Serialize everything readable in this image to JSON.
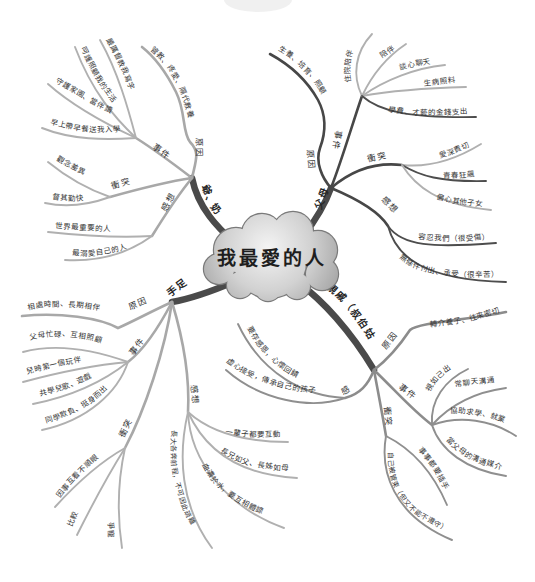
{
  "center": {
    "title": "我最愛的人"
  },
  "branches": [
    {
      "label": "爺、奶",
      "subs": [
        {
          "label": "原因",
          "items": [
            "管教、疼愛、隔代教養"
          ]
        },
        {
          "label": "事件",
          "items": [
            "嚴厲督教我寫字",
            "呵護照顧我的生活",
            "守護家園、當伴讀",
            "早上帶早餐送我入學"
          ]
        },
        {
          "label": "衝突",
          "items": [
            "觀念差異",
            "督其勤快"
          ]
        },
        {
          "label": "感想",
          "items": [
            "世界最重要的人",
            "最溺愛自己的人"
          ]
        }
      ]
    },
    {
      "label": "父母",
      "subs": [
        {
          "label": "原因",
          "items": [
            "生養、培育、照顧"
          ]
        },
        {
          "label": "事件",
          "items": [
            "住院陪伴",
            "陪伴",
            "談心聊天",
            "生病照料",
            "學費、才藝的金錢支出"
          ]
        },
        {
          "label": "衝突",
          "items": [
            "愛深責切",
            "青春狂飆",
            "偏心其他子女"
          ]
        },
        {
          "label": "感想",
          "items": [
            "容忍我們（很受傷）",
            "無條件付出、承受（很辛苦）"
          ]
        }
      ]
    },
    {
      "label": "親戚（叔伯姑姨）",
      "subs": [
        {
          "label": "原因",
          "items": [
            "轉介養子、往來密切"
          ]
        },
        {
          "label": "事件",
          "items": [
            "視如己出",
            "常聊天溝通",
            "協助求學、就業",
            "當父母的溝通媒介"
          ]
        },
        {
          "label": "衝突",
          "items": [
            "事事都要插手",
            "自己被管束（但又不能不遵守）"
          ]
        },
        {
          "label": "感想",
          "items": [
            "要存感恩，心懷回饋",
            "虛心接受，傳承自己的孩子"
          ]
        }
      ]
    },
    {
      "label": "手足",
      "subs": [
        {
          "label": "原因",
          "items": [
            "相處時間、長期相伴"
          ]
        },
        {
          "label": "事件",
          "items": [
            "父母忙碌、互相照顧",
            "兒時第一個玩伴",
            "共學兒歌、遊戲",
            "同學欺負、挺身而出"
          ]
        },
        {
          "label": "衝突",
          "items": [
            "因事互看不順眼",
            "比較",
            "爭寵"
          ]
        },
        {
          "label": "感想",
          "items": [
            "一輩子都要互動",
            "長兄如父、長姊如母",
            "血濃於水，要互相體諒",
            "長大各奔前程，不可因此疏離"
          ]
        }
      ]
    }
  ],
  "colors": {
    "main_branch": "#4a4a4a",
    "sub_dark": "#474747",
    "sub_light": "#a8a8a8",
    "cloud_fill": "#c4c4c4",
    "cloud_outline": "#7a7a7a",
    "text": "#2a2a2a"
  }
}
